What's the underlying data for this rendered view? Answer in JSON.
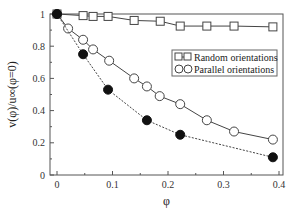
{
  "chart_data": {
    "type": "line",
    "title": "",
    "xlabel": "φ",
    "ylabel": "v(φ)/u∞(φ=0)",
    "xlim": [
      0,
      0.4
    ],
    "ylim": [
      0,
      1
    ],
    "xticks": [
      "0",
      "0.1",
      "0.2",
      "0.3",
      "0.4"
    ],
    "yticks": [
      "0",
      "0.2",
      "0.4",
      "0.6",
      "0.8",
      "1"
    ],
    "grid": false,
    "legend_position": "upper right (inside)",
    "series": [
      {
        "name": "Random orientations",
        "marker": "open-square",
        "line": "solid",
        "x": [
          0,
          0.047,
          0.065,
          0.092,
          0.139,
          0.186,
          0.222,
          0.27,
          0.319,
          0.389
        ],
        "y": [
          1.0,
          0.99,
          0.985,
          0.985,
          0.96,
          0.955,
          0.925,
          0.925,
          0.925,
          0.92
        ]
      },
      {
        "name": "Parallel orientations",
        "marker": "open-circle",
        "line": "solid",
        "x": [
          0,
          0.02,
          0.047,
          0.065,
          0.094,
          0.139,
          0.162,
          0.185,
          0.222,
          0.27,
          0.319,
          0.389
        ],
        "y": [
          1.0,
          0.91,
          0.84,
          0.78,
          0.71,
          0.6,
          0.55,
          0.49,
          0.44,
          0.34,
          0.27,
          0.22
        ]
      },
      {
        "name": "(unlabeled) filled",
        "marker": "filled-circle",
        "line": "dotted",
        "x": [
          0,
          0.047,
          0.092,
          0.162,
          0.222,
          0.389
        ],
        "y": [
          1.0,
          0.75,
          0.53,
          0.34,
          0.25,
          0.11
        ]
      }
    ]
  },
  "legend": {
    "items": [
      "Random orientations",
      "Parallel orientations"
    ]
  }
}
